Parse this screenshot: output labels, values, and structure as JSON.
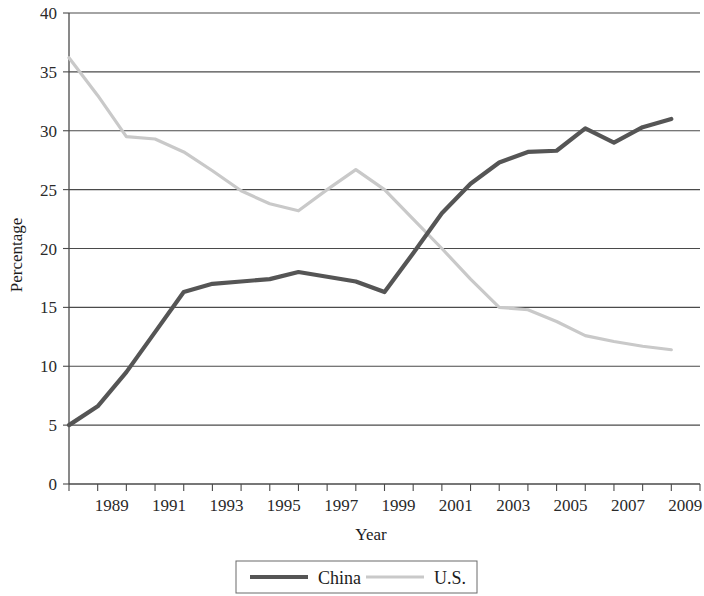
{
  "chart_data": {
    "type": "line",
    "title": "",
    "xlabel": "Year",
    "ylabel": "Percentage",
    "xlim": [
      1988,
      2010
    ],
    "ylim": [
      0,
      40
    ],
    "yticks": [
      0,
      5,
      10,
      15,
      20,
      25,
      30,
      35,
      40
    ],
    "ytick_labels": [
      "0",
      "5",
      "10",
      "15",
      "20",
      "25",
      "30",
      "35",
      "40"
    ],
    "xticks": [
      1988,
      1989,
      1990,
      1991,
      1992,
      1993,
      1994,
      1995,
      1996,
      1997,
      1998,
      1999,
      2000,
      2001,
      2002,
      2003,
      2004,
      2005,
      2006,
      2007,
      2008,
      2009,
      2010
    ],
    "xtick_labels_shown": [
      "1989",
      "1991",
      "1993",
      "1995",
      "1997",
      "1999",
      "2001",
      "2003",
      "2005",
      "2007",
      "2009"
    ],
    "xtick_label_years": [
      1989,
      1991,
      1993,
      1995,
      1997,
      1999,
      2001,
      2003,
      2005,
      2007,
      2009
    ],
    "grid": "horizontal",
    "legend_position": "bottom",
    "x": [
      1988,
      1989,
      1990,
      1991,
      1992,
      1993,
      1994,
      1995,
      1996,
      1997,
      1998,
      1999,
      2000,
      2001,
      2002,
      2003,
      2004,
      2005,
      2006,
      2007,
      2008,
      2009
    ],
    "series": [
      {
        "name": "China",
        "color": "#555555",
        "stroke_width": 4.2,
        "values": [
          5.0,
          6.6,
          9.5,
          12.9,
          16.3,
          17.0,
          17.2,
          17.4,
          18.0,
          17.6,
          17.2,
          16.3,
          19.6,
          23.0,
          25.5,
          27.3,
          28.2,
          28.3,
          30.2,
          29.0,
          30.3,
          31.0
        ]
      },
      {
        "name": "U.S.",
        "color": "#c9c9c9",
        "stroke_width": 3.2,
        "values": [
          36.2,
          33.0,
          29.5,
          29.3,
          28.2,
          26.6,
          24.9,
          23.8,
          23.2,
          25.0,
          26.7,
          25.0,
          22.5,
          20.0,
          17.4,
          15.0,
          14.8,
          13.8,
          12.6,
          12.1,
          11.7,
          11.4
        ]
      }
    ]
  },
  "legend": {
    "entries": [
      {
        "label": "China"
      },
      {
        "label": "U.S."
      }
    ]
  },
  "axis": {
    "x_title": "Year",
    "y_title": "Percentage"
  }
}
